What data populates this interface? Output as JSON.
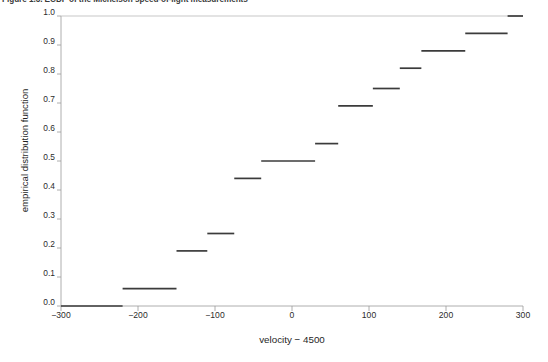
{
  "caption": {
    "text": "Figure 1.3. ECDF of the Michelson speed-of-light measurements"
  },
  "axes": {
    "y_title": "empirical distribution function",
    "x_title": "velocity − 4500",
    "y_ticks": [
      "0.0",
      "0.1",
      "0.2",
      "0.3",
      "0.4",
      "0.5",
      "0.6",
      "0.7",
      "0.8",
      "0.9",
      "1.0"
    ],
    "x_ticks": [
      "−300",
      "−200",
      "−100",
      "0",
      "100",
      "200",
      "300"
    ],
    "axis_color": "#9a9a9a",
    "step_color": "#3b3b3b"
  },
  "chart_data": {
    "type": "line",
    "subtype": "step-ecdf",
    "title": "",
    "xlabel": "velocity − 4500",
    "ylabel": "empirical distribution function",
    "xlim": [
      -300,
      300
    ],
    "ylim": [
      0.0,
      1.0
    ],
    "xticks": [
      -300,
      -200,
      -100,
      0,
      100,
      200,
      300
    ],
    "yticks": [
      0.0,
      0.1,
      0.2,
      0.3,
      0.4,
      0.5,
      0.6,
      0.7,
      0.8,
      0.9,
      1.0
    ],
    "grid": false,
    "legend": "none",
    "step_segments": [
      {
        "x_start": -300,
        "x_end": -220,
        "y": 0.0
      },
      {
        "x_start": -220,
        "x_end": -150,
        "y": 0.06
      },
      {
        "x_start": -150,
        "x_end": -110,
        "y": 0.19
      },
      {
        "x_start": -110,
        "x_end": -75,
        "y": 0.25
      },
      {
        "x_start": -75,
        "x_end": -40,
        "y": 0.44
      },
      {
        "x_start": -40,
        "x_end": 30,
        "y": 0.5
      },
      {
        "x_start": 30,
        "x_end": 60,
        "y": 0.56
      },
      {
        "x_start": 60,
        "x_end": 105,
        "y": 0.69
      },
      {
        "x_start": 105,
        "x_end": 140,
        "y": 0.75
      },
      {
        "x_start": 140,
        "x_end": 168,
        "y": 0.82
      },
      {
        "x_start": 168,
        "x_end": 225,
        "y": 0.88
      },
      {
        "x_start": 225,
        "x_end": 280,
        "y": 0.94
      },
      {
        "x_start": 280,
        "x_end": 300,
        "y": 1.0
      }
    ],
    "x": [
      -300,
      -220,
      -150,
      -110,
      -75,
      -40,
      30,
      60,
      105,
      140,
      168,
      225,
      280,
      300
    ],
    "y": [
      0.0,
      0.06,
      0.19,
      0.25,
      0.44,
      0.5,
      0.56,
      0.69,
      0.75,
      0.82,
      0.88,
      0.94,
      1.0,
      1.0
    ]
  }
}
